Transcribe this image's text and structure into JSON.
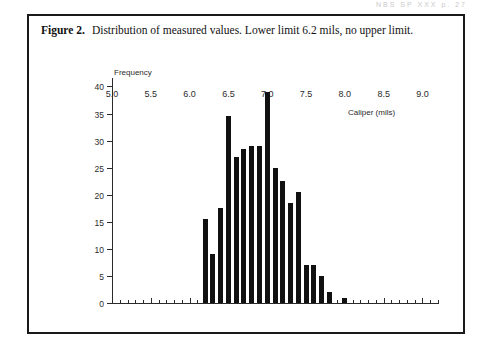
{
  "page_header": "NBS SP XXX    p.  27",
  "figure": {
    "number": "Figure 2.",
    "caption": "Distribution of measured values. Lower limit 6.2 mils, no upper limit."
  },
  "chart_data": {
    "type": "bar",
    "title": "Distribution of measured values. Lower limit 6.2 mils, no upper limit.",
    "xlabel": "Caliper (mils)",
    "ylabel": "Frequency",
    "xlim": [
      5.0,
      9.2
    ],
    "ylim": [
      0,
      41
    ],
    "grid": false,
    "legend": null,
    "bin_width": 0.1,
    "x_major_ticks": [
      5.0,
      5.5,
      6.0,
      6.5,
      7.0,
      7.5,
      8.0,
      8.5,
      9.0
    ],
    "x_major_tick_labels": [
      "5.0",
      "5.5",
      "6.0",
      "6.5",
      "7.0",
      "7.5",
      "8.0",
      "8.5",
      "9.0"
    ],
    "x_minor_tick_step": 0.1,
    "y_ticks": [
      0,
      5,
      10,
      15,
      20,
      25,
      30,
      35,
      40
    ],
    "y_tick_labels": [
      "0",
      "5",
      "10",
      "15",
      "20",
      "25",
      "30",
      "35",
      "40"
    ],
    "categories": [
      "6.2",
      "6.3",
      "6.4",
      "6.5",
      "6.6",
      "6.7",
      "6.8",
      "6.9",
      "7.0",
      "7.1",
      "7.2",
      "7.3",
      "7.4",
      "7.5",
      "7.6",
      "7.7",
      "7.8",
      "8.0"
    ],
    "x": [
      6.2,
      6.3,
      6.4,
      6.5,
      6.6,
      6.7,
      6.8,
      6.9,
      7.0,
      7.1,
      7.2,
      7.3,
      7.4,
      7.5,
      7.6,
      7.7,
      7.8,
      8.0
    ],
    "values": [
      15.5,
      9,
      17.5,
      34.5,
      27,
      28.5,
      29,
      29,
      39,
      25,
      22.5,
      18.5,
      20.5,
      7,
      7,
      5,
      2,
      1
    ],
    "bar_color": "#111111",
    "annotations": {
      "lower_limit": 6.2,
      "upper_limit": null,
      "lower_limit_text": "Lower limit 6.2 mils",
      "upper_limit_text": "no upper limit"
    }
  }
}
